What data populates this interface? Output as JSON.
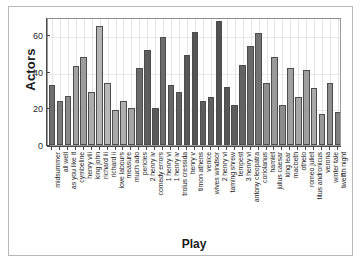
{
  "chart_data": {
    "type": "bar",
    "title": "",
    "xlabel": "Play",
    "ylabel": "Actors",
    "ylim": [
      0,
      70
    ],
    "yticks": [
      0,
      20,
      40,
      60
    ],
    "ytick_labels": [
      "0",
      "20",
      "40",
      "60"
    ],
    "grid": true,
    "legend": null,
    "categories": [
      "midsummer",
      "all well",
      "as you like it",
      "cymbeline",
      "henry viii",
      "king john",
      "richard iii",
      "richard ii",
      "love labours",
      "measure",
      "much ado",
      "pericles",
      "2 henry iv",
      "comedy errors",
      "1 henry vi",
      "1 henry iv",
      "trolus cressida",
      "henry v",
      "timon athens",
      "venice",
      "wives windsor",
      "2 henry vi",
      "taming shrew",
      "tempest",
      "3 henry vi",
      "antony cleopatra",
      "coriolanus",
      "hamlet",
      "julius caesar",
      "king lear",
      "macbeth",
      "othelo",
      "romeo juliet",
      "titus andronicus",
      "verona",
      "winter tale",
      "twelfth night"
    ],
    "values": [
      33,
      24,
      27,
      43,
      48,
      29,
      65,
      34,
      19,
      24,
      20,
      42,
      52,
      20,
      59,
      33,
      29,
      49,
      62,
      24,
      26,
      68,
      32,
      22,
      44,
      54,
      61,
      34,
      48,
      22,
      42,
      26,
      41,
      31,
      17,
      34,
      18
    ],
    "bar_colors": [
      "#6e6e6e",
      "#7b7b7b",
      "#8a8a8a",
      "#a3a3a3",
      "#9c9c9c",
      "#adadad",
      "#b4b4b4",
      "#b8b8b8",
      "#a8a8a8",
      "#aeaeae",
      "#a5a5a5",
      "#6a6a6a",
      "#5e5e5e",
      "#5a5a5a",
      "#6b6b6b",
      "#676767",
      "#606060",
      "#585858",
      "#555555",
      "#5c5c5c",
      "#5f5f5f",
      "#525252",
      "#565656",
      "#5d5d5d",
      "#636363",
      "#6a6a6a",
      "#737373",
      "#8f8f8f",
      "#9a9a9a",
      "#8b8b8b",
      "#a0a0a0",
      "#a6a6a6",
      "#9e9e9e",
      "#a9a9a9",
      "#9a9a9a",
      "#8e8e8e",
      "#7f7f7f"
    ]
  }
}
